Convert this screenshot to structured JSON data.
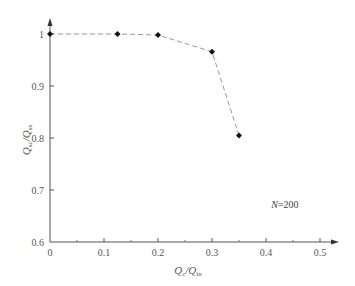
{
  "chart_data": {
    "type": "line",
    "title": "",
    "xlabel": "Qc/Qin",
    "ylabel": "Qsc/Qss",
    "xlabel_parts": {
      "main": "Q",
      "sub1": "c",
      "sep": "/Q",
      "sub2": "in"
    },
    "ylabel_parts": {
      "main": "Q",
      "sub1": "sc",
      "sep": "/Q",
      "sub2": "ss"
    },
    "xlim": [
      0,
      0.5
    ],
    "ylim": [
      0.6,
      1.0
    ],
    "x_ticks": [
      "0",
      "0.1",
      "0.2",
      "0.3",
      "0.4",
      "0.5"
    ],
    "y_ticks": [
      "0.6",
      "0.7",
      "0.8",
      "0.9",
      "1"
    ],
    "grid": false,
    "legend": null,
    "annotations": [
      {
        "text": "N=200",
        "italic_part": "N",
        "rest": "=200",
        "x": 0.435,
        "y": 0.665
      }
    ],
    "series": [
      {
        "name": "N=200",
        "line_style": "dashed",
        "marker": "diamond",
        "color": "#999999",
        "marker_color": "#111111",
        "x": [
          0,
          0.125,
          0.2,
          0.3,
          0.35
        ],
        "y": [
          1.0,
          1.0,
          0.998,
          0.966,
          0.805
        ]
      }
    ]
  }
}
